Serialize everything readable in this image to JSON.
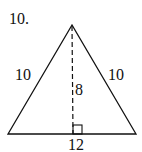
{
  "problem_number": "10.",
  "figure": {
    "shape": "isosceles triangle",
    "left_side": "10",
    "right_side": "10",
    "height": "8",
    "base": "12",
    "line_color": "#111111"
  }
}
